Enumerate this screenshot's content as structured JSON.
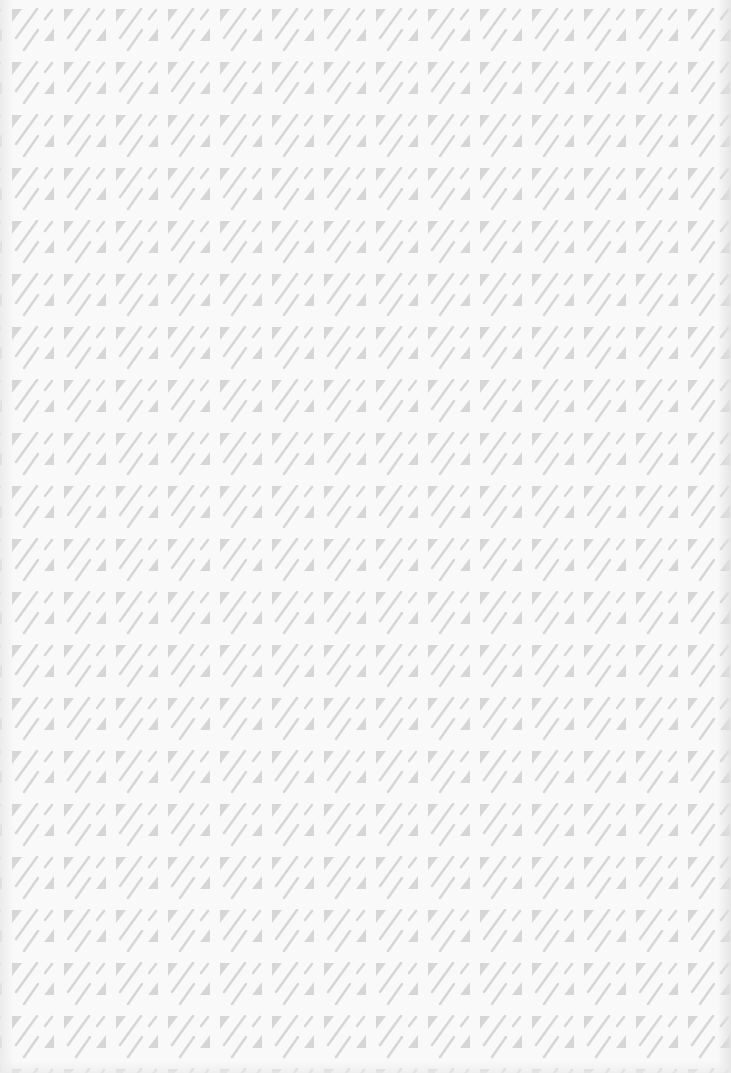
{
  "canvas": {
    "width": 731,
    "height": 1073,
    "background": "#f9f9f9"
  },
  "pattern": {
    "description": "Repeating geometric tile of gray triangles and diagonal strokes",
    "tile_width": 52,
    "tile_height": 53,
    "offset_x": 12,
    "offset_y": 8,
    "shape_color": "#d6d6d6",
    "elements": [
      "top-left-triangle-icon",
      "long-diagonal-stroke",
      "short-diagonal-stroke",
      "lower-diagonal-stroke",
      "bottom-right-triangle-icon"
    ]
  }
}
